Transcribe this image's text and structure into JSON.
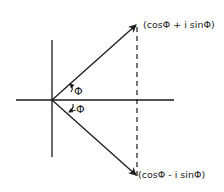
{
  "diagram": {
    "type": "complex-plane-conjugate-vectors",
    "labels": {
      "upper_point": "(cosΦ + i sinΦ)",
      "lower_point": "(cosΦ - i sinΦ)",
      "upper_angle": "Φ",
      "lower_angle": "-Φ"
    },
    "colors": {
      "ink": "#1a1a1a",
      "background": "#ffffff"
    }
  }
}
